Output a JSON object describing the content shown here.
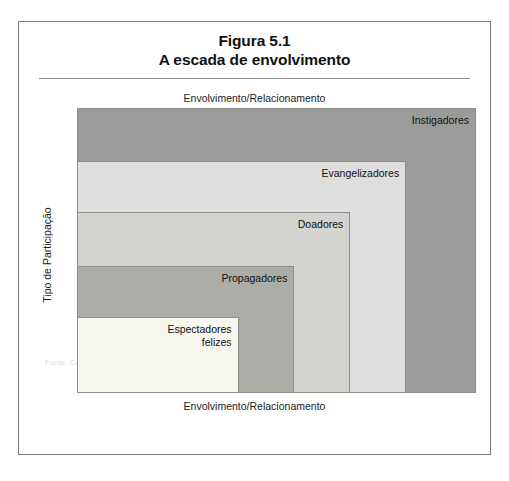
{
  "figure": {
    "title_line1": "Figura 5.1",
    "title_line2": "A escada de envolvimento",
    "source_note": "Fonte: Copyright©2010 por Beth Kanter. Todos os direitos reservados."
  },
  "axes": {
    "top_caption": "Envolvimento/Relacionamento",
    "bottom_caption": "Envolvimento/Relacionamento",
    "y_caption": "Tipo de Participação"
  },
  "chart_data": {
    "type": "bar",
    "title": "A escada de envolvimento",
    "xlabel": "Envolvimento/Relacionamento",
    "ylabel": "Tipo de Participação",
    "grid": false,
    "legend": "none",
    "categories": [
      "Escutar",
      "Partilhar",
      "Dinheiro",
      "Perguntar",
      "Criar"
    ],
    "series": [
      {
        "name": "Escada de envolvimento",
        "values": [
          1,
          2,
          3,
          4,
          5
        ]
      }
    ],
    "steps": [
      {
        "label": "Espectadores\nfelizes",
        "tick": "Escutar",
        "level": 1,
        "width_pct": 40.5,
        "height_pct": 26.5,
        "color": "#f7f6ef"
      },
      {
        "label": "Propagadores",
        "tick": "Partilhar",
        "level": 2,
        "width_pct": 54.5,
        "height_pct": 44.5,
        "color": "#adada8"
      },
      {
        "label": "Doadores",
        "tick": "Dinheiro",
        "level": 3,
        "width_pct": 68.5,
        "height_pct": 63.5,
        "color": "#d3d3cf"
      },
      {
        "label": "Evangelizadores",
        "tick": "Perguntar",
        "level": 4,
        "width_pct": 82.5,
        "height_pct": 81.5,
        "color": "#dedede"
      },
      {
        "label": "Instigadores",
        "tick": "Criar",
        "level": 5,
        "width_pct": 100,
        "height_pct": 100,
        "color": "#9b9b99"
      }
    ]
  }
}
